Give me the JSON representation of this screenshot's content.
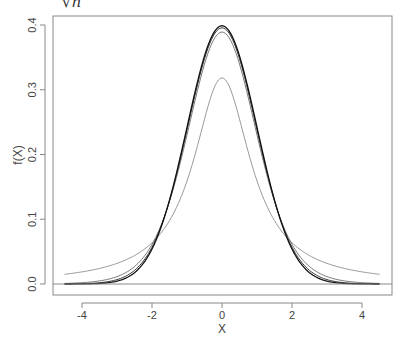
{
  "chart_data": {
    "type": "line",
    "title": "√n",
    "xlabel": "X",
    "ylabel": "f(X)",
    "xlim": [
      -4.5,
      4.5
    ],
    "ylim": [
      0.0,
      0.4
    ],
    "xticks": [
      "-4",
      "-2",
      "0",
      "2",
      "4"
    ],
    "yticks": [
      "0.0",
      "0.1",
      "0.2",
      "0.3",
      "0.4"
    ],
    "grid": false,
    "legend": "none",
    "series": [
      {
        "name": "t (df=1)",
        "kind": "t",
        "df": 1,
        "peak": 0.318,
        "color": "#9a9a9a"
      },
      {
        "name": "t (df=10)",
        "kind": "t",
        "df": 10,
        "peak": 0.389,
        "color": "#7a7a7a"
      },
      {
        "name": "t (df=30)",
        "kind": "t",
        "df": 30,
        "peak": 0.396,
        "color": "#3a3a3a"
      },
      {
        "name": "Normal",
        "kind": "normal",
        "peak": 0.399,
        "color": "#111111"
      }
    ],
    "hline": 0.0
  }
}
